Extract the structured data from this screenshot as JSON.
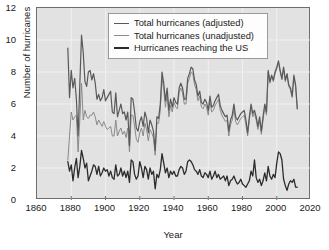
{
  "chart_data": {
    "type": "line",
    "title": "",
    "xlabel": "Year",
    "ylabel": "Number of hurricanes",
    "xlim": [
      1860,
      2020
    ],
    "ylim": [
      0,
      12
    ],
    "xticks": [
      1860,
      1880,
      1900,
      1920,
      1940,
      1960,
      1980,
      2000,
      2020
    ],
    "yticks": [
      0,
      2,
      4,
      6,
      8,
      10,
      12
    ],
    "grid": true,
    "legend_position": "top-center",
    "colors": {
      "adjusted": "#595959",
      "unadjusted": "#8a8a8a",
      "us_landfall": "#2b2b2b",
      "plot_background": "#e2e2e2",
      "gridline": "#f2f2f2",
      "axis": "#6e6e6e"
    },
    "x": [
      1878,
      1879,
      1880,
      1881,
      1882,
      1883,
      1884,
      1885,
      1886,
      1887,
      1888,
      1889,
      1890,
      1891,
      1892,
      1893,
      1894,
      1895,
      1896,
      1897,
      1898,
      1899,
      1900,
      1901,
      1902,
      1903,
      1904,
      1905,
      1906,
      1907,
      1908,
      1909,
      1910,
      1911,
      1912,
      1913,
      1914,
      1915,
      1916,
      1917,
      1918,
      1919,
      1920,
      1921,
      1922,
      1923,
      1924,
      1925,
      1926,
      1927,
      1928,
      1929,
      1930,
      1931,
      1932,
      1933,
      1934,
      1935,
      1936,
      1937,
      1938,
      1939,
      1940,
      1941,
      1942,
      1943,
      1944,
      1945,
      1946,
      1947,
      1948,
      1949,
      1950,
      1951,
      1952,
      1953,
      1954,
      1955,
      1956,
      1957,
      1958,
      1959,
      1960,
      1961,
      1962,
      1963,
      1964,
      1965,
      1966,
      1967,
      1968,
      1969,
      1970,
      1971,
      1972,
      1973,
      1974,
      1975,
      1976,
      1977,
      1978,
      1979,
      1980,
      1981,
      1982,
      1983,
      1984,
      1985,
      1986,
      1987,
      1988,
      1989,
      1990,
      1991,
      1992,
      1993,
      1994,
      1995,
      1996,
      1997,
      1998,
      1999,
      2000,
      2001,
      2002,
      2003,
      2004,
      2005,
      2006,
      2007,
      2008,
      2009,
      2010,
      2011,
      2012
    ],
    "series": [
      {
        "name": "Total hurricanes (adjusted)",
        "values": [
          9.5,
          6.4,
          8.1,
          7.0,
          7.6,
          6.3,
          4.0,
          7.2,
          10.3,
          9.2,
          7.4,
          7.1,
          8.0,
          8.1,
          7.5,
          7.9,
          7.3,
          6.3,
          6.6,
          6.2,
          6.4,
          6.9,
          6.2,
          6.4,
          6.6,
          6.8,
          5.5,
          5.4,
          6.7,
          5.2,
          5.6,
          6.0,
          5.4,
          5.5,
          5.0,
          5.5,
          3.4,
          6.4,
          6.3,
          5.5,
          4.5,
          4.3,
          4.9,
          5.2,
          4.6,
          5.5,
          5.1,
          4.2,
          5.0,
          4.7,
          4.3,
          3.1,
          5.2,
          5.1,
          6.0,
          8.0,
          7.3,
          6.2,
          7.0,
          5.6,
          6.3,
          5.8,
          6.4,
          6.1,
          6.0,
          7.0,
          7.3,
          7.0,
          6.3,
          6.3,
          7.6,
          7.9,
          8.3,
          8.2,
          7.5,
          7.2,
          6.5,
          6.8,
          6.1,
          6.0,
          6.3,
          6.1,
          5.6,
          6.5,
          5.8,
          5.9,
          6.2,
          6.4,
          6.6,
          5.9,
          5.6,
          5.4,
          5.2,
          5.3,
          4.3,
          5.0,
          5.3,
          6.0,
          5.2,
          5.0,
          5.2,
          5.4,
          5.5,
          5.6,
          5.0,
          4.2,
          5.2,
          6.0,
          5.4,
          5.6,
          5.2,
          4.6,
          5.2,
          4.3,
          5.2,
          6.0,
          5.5,
          8.1,
          7.4,
          7.8,
          7.5,
          8.0,
          8.3,
          8.7,
          8.1,
          7.6,
          8.3,
          7.5,
          7.9,
          7.2,
          7.0,
          6.5,
          7.8,
          7.2,
          5.7
        ]
      },
      {
        "name": "Total hurricanes (unadjusted)",
        "values": [
          2.5,
          4.0,
          5.5,
          5.0,
          5.2,
          5.3,
          3.0,
          5.0,
          7.3,
          5.0,
          5.6,
          5.2,
          5.1,
          5.3,
          5.3,
          5.5,
          5.2,
          4.7,
          5.0,
          4.8,
          4.6,
          4.9,
          4.6,
          4.4,
          4.5,
          4.6,
          4.0,
          4.0,
          5.0,
          4.0,
          4.3,
          4.5,
          4.1,
          4.3,
          3.9,
          4.5,
          3.0,
          5.3,
          5.3,
          4.6,
          3.8,
          3.6,
          4.2,
          4.5,
          4.0,
          4.8,
          4.4,
          3.7,
          4.4,
          4.2,
          3.9,
          2.8,
          4.8,
          4.8,
          5.6,
          7.6,
          6.9,
          5.8,
          6.6,
          5.2,
          5.9,
          5.5,
          6.1,
          5.8,
          5.7,
          6.7,
          7.0,
          6.7,
          6.0,
          6.0,
          7.3,
          7.6,
          8.0,
          7.9,
          7.2,
          6.9,
          6.2,
          6.5,
          5.8,
          5.7,
          6.0,
          5.8,
          5.3,
          6.2,
          5.5,
          5.6,
          5.9,
          6.1,
          6.3,
          5.6,
          5.3,
          5.1,
          4.9,
          5.0,
          4.0,
          4.7,
          5.0,
          5.7,
          4.9,
          4.7,
          4.9,
          5.1,
          5.2,
          5.3,
          4.7,
          4.0,
          5.0,
          5.8,
          5.2,
          5.4,
          5.0,
          4.4,
          5.0,
          4.1,
          5.0,
          5.8,
          5.3,
          8.0,
          7.3,
          7.7,
          7.4,
          7.9,
          8.2,
          8.6,
          8.0,
          7.5,
          8.2,
          7.4,
          7.8,
          7.1,
          6.9,
          6.4,
          7.7,
          7.1,
          5.7
        ]
      },
      {
        "name": "Hurricanes reaching the US",
        "values": [
          2.4,
          1.8,
          2.2,
          1.2,
          2.0,
          2.6,
          1.4,
          2.1,
          3.1,
          2.6,
          2.0,
          2.3,
          1.2,
          1.5,
          1.8,
          2.2,
          2.1,
          1.6,
          2.1,
          1.5,
          1.7,
          2.0,
          1.8,
          1.9,
          1.5,
          1.8,
          1.4,
          1.3,
          2.2,
          1.5,
          1.6,
          2.0,
          1.5,
          1.8,
          1.4,
          1.8,
          1.1,
          2.5,
          2.4,
          1.6,
          1.3,
          1.5,
          2.4,
          2.0,
          1.4,
          2.1,
          1.9,
          1.3,
          2.0,
          1.6,
          1.8,
          0.7,
          1.6,
          1.4,
          1.9,
          2.9,
          2.3,
          1.7,
          2.0,
          1.4,
          1.8,
          1.6,
          1.8,
          1.5,
          1.5,
          1.9,
          2.1,
          2.0,
          1.6,
          1.8,
          2.4,
          2.5,
          2.4,
          2.2,
          1.9,
          1.8,
          1.6,
          1.9,
          1.5,
          1.4,
          1.7,
          1.6,
          1.4,
          1.8,
          1.3,
          1.5,
          1.8,
          1.4,
          1.6,
          1.3,
          1.4,
          1.5,
          1.2,
          1.5,
          0.9,
          1.2,
          1.3,
          1.5,
          1.2,
          1.0,
          1.1,
          1.3,
          1.0,
          0.9,
          0.8,
          1.0,
          1.2,
          1.8,
          1.5,
          2.5,
          1.4,
          1.1,
          1.3,
          0.9,
          1.2,
          1.7,
          1.2,
          2.1,
          1.5,
          1.3,
          1.6,
          1.4,
          2.3,
          3.0,
          2.9,
          2.5,
          1.3,
          0.9,
          0.6,
          1.0,
          1.2,
          1.1,
          1.3,
          0.8,
          0.8
        ]
      }
    ]
  },
  "legend": {
    "items": [
      {
        "label": "Total hurricanes (adjusted)"
      },
      {
        "label": "Total hurricanes (unadjusted)"
      },
      {
        "label": "Hurricanes reaching the US"
      }
    ]
  }
}
